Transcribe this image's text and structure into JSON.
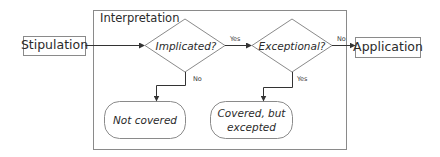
{
  "diagram": {
    "type": "flowchart",
    "colors": {
      "stroke": "#7a7a7a",
      "arrow": "#333333",
      "text": "#2b2b2b",
      "background": "#ffffff"
    },
    "nodes": {
      "stipulation": {
        "label": "Stipulation",
        "shape": "rectangle"
      },
      "group": {
        "label": "Interpretation",
        "shape": "container"
      },
      "implicated": {
        "label": "Implicated?",
        "shape": "diamond"
      },
      "exceptional": {
        "label": "Exceptional?",
        "shape": "diamond"
      },
      "application": {
        "label": "Application",
        "shape": "rectangle"
      },
      "not_covered": {
        "label": "Not covered",
        "shape": "rounded-terminal"
      },
      "covered_excepted": {
        "line1": "Covered, but",
        "line2": "excepted",
        "shape": "rounded-terminal"
      }
    },
    "edges": {
      "stip_to_impl": {
        "from": "Stipulation",
        "to": "Implicated?",
        "label": ""
      },
      "impl_yes": {
        "from": "Implicated?",
        "to": "Exceptional?",
        "label": "Yes"
      },
      "impl_no": {
        "from": "Implicated?",
        "to": "Not covered",
        "label": "No"
      },
      "exc_no": {
        "from": "Exceptional?",
        "to": "Application",
        "label": "No"
      },
      "exc_yes": {
        "from": "Exceptional?",
        "to": "Covered, but excepted",
        "label": "Yes"
      }
    }
  }
}
